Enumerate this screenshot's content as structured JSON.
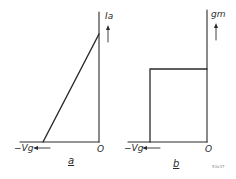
{
  "panels": [
    {
      "id": "a",
      "label": "a",
      "y_axis_label": "Ia",
      "x_axis_label": "−Vg",
      "origin_label": "O",
      "curve": "linear ramp from cutoff to origin"
    },
    {
      "id": "b",
      "label": "b",
      "y_axis_label": "gm",
      "x_axis_label": "−Vg",
      "origin_label": "O",
      "curve": "constant step between cutoff and origin"
    }
  ],
  "figure_tag": "53x37",
  "colors": {
    "line": "#2a2a2a",
    "background": "#ffffff"
  }
}
